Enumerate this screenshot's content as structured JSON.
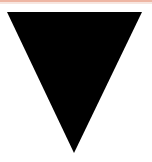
{
  "element": {
    "shape": "down-triangle",
    "fill_color": "#000000",
    "background_color": "#ffffff",
    "top_strip_color": "#eeb6a4",
    "points": {
      "top_left": [
        7,
        12
      ],
      "top_right": [
        142,
        12
      ],
      "bottom": [
        74,
        153
      ]
    }
  }
}
